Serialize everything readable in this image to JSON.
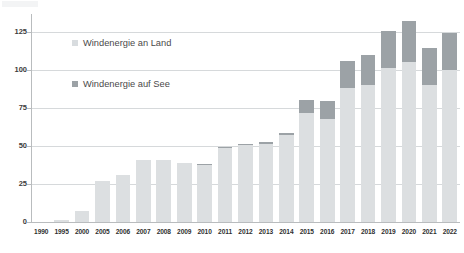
{
  "chart_data": {
    "type": "bar",
    "stacked": true,
    "title": "",
    "subtitle": "",
    "xlabel": "",
    "ylabel": "",
    "ylim": [
      0,
      137
    ],
    "yticks": [
      0,
      25,
      50,
      75,
      100,
      125
    ],
    "grid": true,
    "legend_position": "inside-top-left",
    "categories": [
      "1990",
      "1995",
      "2000",
      "2005",
      "2006",
      "2007",
      "2008",
      "2009",
      "2010",
      "2011",
      "2012",
      "2013",
      "2014",
      "2015",
      "2016",
      "2017",
      "2018",
      "2019",
      "2020",
      "2021",
      "2022"
    ],
    "series": [
      {
        "name": "Windenergie an Land",
        "color": "#dcdfe1",
        "values": [
          0.1,
          1.5,
          7.5,
          27.2,
          30.7,
          40.6,
          40.6,
          38.6,
          37.8,
          49.0,
          50.7,
          51.7,
          57.4,
          72.0,
          67.7,
          88.0,
          90.5,
          101.2,
          105.3,
          90.0,
          100.0
        ]
      },
      {
        "name": "Windenergie auf See",
        "color": "#9ca2a6",
        "values": [
          0,
          0,
          0,
          0,
          0,
          0,
          0,
          0,
          0.2,
          0.6,
          0.7,
          0.9,
          1.4,
          8.3,
          12.1,
          18.3,
          19.5,
          24.7,
          27.3,
          24.4,
          24.8
        ]
      }
    ],
    "totals": [
      0.1,
      1.5,
      7.5,
      27.2,
      30.7,
      40.6,
      40.6,
      38.6,
      38.0,
      49.6,
      51.4,
      52.6,
      58.8,
      80.3,
      79.8,
      106.3,
      110.0,
      125.9,
      132.6,
      114.4,
      124.8
    ]
  },
  "legend": {
    "items": [
      {
        "label": "Windenergie an Land",
        "color": "#dcdfe1"
      },
      {
        "label": "Windenergie auf See",
        "color": "#9ca2a6"
      }
    ]
  },
  "axis": {
    "y_tick_labels": [
      "125",
      "100",
      "75",
      "50",
      "25",
      "0"
    ],
    "x_tick_labels": [
      "1990",
      "1995",
      "2000",
      "2005",
      "2006",
      "2007",
      "2008",
      "2009",
      "2010",
      "2011",
      "2012",
      "2013",
      "2014",
      "2015",
      "2016",
      "2017",
      "2018",
      "2019",
      "2020",
      "2021",
      "2022"
    ]
  },
  "colors": {
    "land": "#dcdfe1",
    "sea": "#9ca2a6",
    "grid": "#d6d9db",
    "axis": "#b9bcbe",
    "text": "#3c3c3c",
    "background": "#ffffff"
  }
}
